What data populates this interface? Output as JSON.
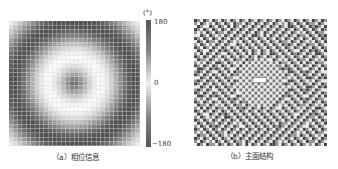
{
  "figure": {
    "panel_a": {
      "caption": "（a）相位信息",
      "colorbar": {
        "unit": "(°)",
        "ticks": [
          "180",
          "0",
          "−180"
        ]
      }
    },
    "panel_b": {
      "caption": "（b）主面结构"
    }
  }
}
